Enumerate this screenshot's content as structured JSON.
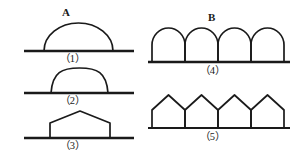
{
  "figure": {
    "background_color": "#ffffff",
    "stroke_color": "#1a1a1a",
    "width": 299,
    "height": 161,
    "groups": [
      {
        "id": "A",
        "label": "A",
        "description": "Left column of single-span shapes"
      },
      {
        "id": "B",
        "label": "B",
        "description": "Right column of repeated-span shapes"
      }
    ],
    "captions": {
      "fig1": "（1）",
      "fig2": "（2）",
      "fig3": "（3）",
      "fig4": "（4）",
      "fig5": "（5）"
    },
    "shapes": [
      {
        "id": "fig1",
        "caption": "（1）",
        "group": "A",
        "kind": "semicircular-arch",
        "spans": 1,
        "baseline_y": 51,
        "baseline_x1": 24,
        "baseline_x2": 134,
        "arch_x1": 44,
        "arch_x2": 113,
        "apex_y": 23
      },
      {
        "id": "fig2",
        "caption": "（2）",
        "group": "A",
        "kind": "flattened-dome",
        "spans": 1,
        "baseline_y": 93,
        "baseline_x1": 24,
        "baseline_x2": 134,
        "arch_x1": 51,
        "arch_x2": 108,
        "apex_y": 68
      },
      {
        "id": "fig3",
        "caption": "（3）",
        "group": "A",
        "kind": "peaked-house",
        "spans": 1,
        "baseline_y": 138,
        "baseline_x1": 24,
        "baseline_x2": 134,
        "wall_x1": 50,
        "wall_x2": 110,
        "eave_y": 123,
        "apex_x": 80,
        "apex_y": 111
      },
      {
        "id": "fig4",
        "caption": "（4）",
        "group": "B",
        "kind": "arcade-round-arches",
        "spans": 4,
        "baseline_y": 62,
        "baseline_x1": 148,
        "baseline_x2": 290,
        "span_x1": 152,
        "span_width": 33,
        "spring_y": 45,
        "apex_y": 28
      },
      {
        "id": "fig5",
        "caption": "（5）",
        "group": "B",
        "kind": "arcade-pitched-roofs",
        "spans": 4,
        "baseline_y": 128,
        "baseline_x1": 148,
        "baseline_x2": 290,
        "span_x1": 152,
        "span_width": 33,
        "eave_y": 110,
        "apex_y": 95
      }
    ]
  }
}
